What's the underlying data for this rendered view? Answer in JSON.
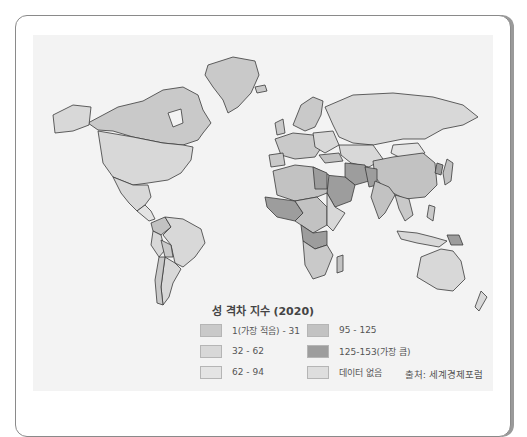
{
  "legend": {
    "title": "성 격차 지수 (2020)",
    "items": [
      {
        "label": "1(가장 적음) - 31",
        "color": "#c9c9c9"
      },
      {
        "label": "32 - 62",
        "color": "#d8d8d8"
      },
      {
        "label": "62 - 94",
        "color": "#e4e4e4"
      },
      {
        "label": "95 - 125",
        "color": "#c2c2c2"
      },
      {
        "label": "125-153(가장 큼)",
        "color": "#9d9d9d"
      },
      {
        "label": "데이터 없음",
        "color": "#dedede"
      }
    ]
  },
  "source": "출처: 세계경제포럼",
  "colors": {
    "ocean": "#f3f3f3",
    "border": "#3a3a3a"
  }
}
